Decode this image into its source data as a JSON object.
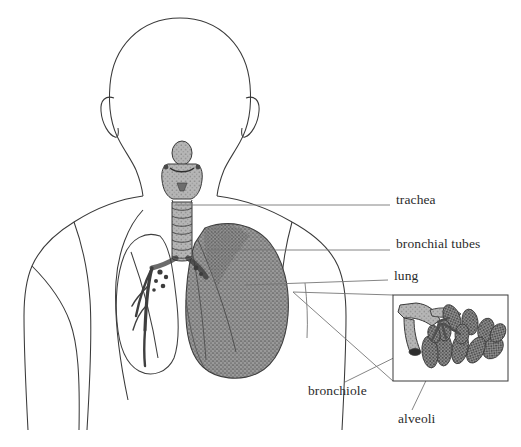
{
  "figure": {
    "view": "posterior view of head and torso with lungs",
    "background_color": "#ffffff",
    "outline_color": "#3a3a3a",
    "lung_fill_color": "#8a8a8a",
    "leader_line_color": "#777777",
    "label_text_color": "#2b2b2b"
  },
  "labels": [
    {
      "id": "trachea",
      "text": "trachea",
      "x": 396,
      "y": 199
    },
    {
      "id": "bronchial-tubes",
      "text": "bronchial tubes",
      "x": 396,
      "y": 243
    },
    {
      "id": "lung",
      "text": "lung",
      "x": 394,
      "y": 275
    },
    {
      "id": "bronchiole",
      "text": "bronchiole",
      "x": 308,
      "y": 390
    },
    {
      "id": "alveoli",
      "text": "alveoli",
      "x": 398,
      "y": 418
    }
  ],
  "leader_lines": [
    {
      "id": "trachea-leader",
      "from": [
        175,
        205
      ],
      "to": [
        390,
        205
      ]
    },
    {
      "id": "bronchial-tubes-leader",
      "from": [
        200,
        250
      ],
      "to": [
        390,
        250
      ]
    },
    {
      "id": "lung-leader",
      "from": [
        245,
        285
      ],
      "to": [
        388,
        280
      ]
    },
    {
      "id": "bronchiole-leader",
      "from": [
        430,
        340
      ],
      "to": [
        345,
        382
      ]
    },
    {
      "id": "alveoli-leader",
      "from": [
        432,
        368
      ],
      "to": [
        412,
        410
      ]
    }
  ],
  "inset": {
    "id": "alveoli-inset",
    "box": {
      "x": 393,
      "y": 295,
      "width": 115,
      "height": 86
    },
    "contents": "bronchiole branching into grape-like alveolar sacs",
    "connector_lines": [
      {
        "from": [
          293,
          292
        ],
        "to": [
          393,
          295
        ]
      },
      {
        "from": [
          293,
          292
        ],
        "to": [
          393,
          381
        ]
      }
    ]
  },
  "body": {
    "head": "featureless rear-view head outline with ears",
    "neck": "neck outline",
    "shoulders": "sloping shoulders and upper arms",
    "torso": "upper torso outline"
  },
  "organs": [
    {
      "id": "larynx",
      "name": "larynx",
      "shaded": true
    },
    {
      "id": "trachea",
      "name": "trachea",
      "shaded": true,
      "note": "segmented cartilage rings"
    },
    {
      "id": "left-lung",
      "name": "left lung",
      "shaded": false,
      "note": "outline only, bronchial tree visible"
    },
    {
      "id": "right-lung",
      "name": "right lung",
      "shaded": true,
      "note": "gray stippled fill with lobe fissures"
    },
    {
      "id": "bronchial-tree",
      "name": "bronchial tubes",
      "shaded": true
    }
  ]
}
